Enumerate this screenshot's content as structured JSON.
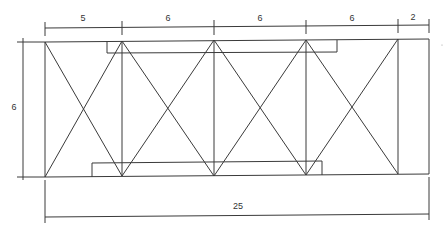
{
  "diagram": {
    "type": "truss-elevation",
    "units_label": "",
    "top_dimensions": [
      {
        "label": "5",
        "x": 83,
        "y": 18
      },
      {
        "label": "6",
        "x": 168,
        "y": 18
      },
      {
        "label": "6",
        "x": 260,
        "y": 18
      },
      {
        "label": "6",
        "x": 352,
        "y": 18
      },
      {
        "label": "2",
        "x": 413,
        "y": 17
      }
    ],
    "left_dimension": {
      "label": "6",
      "x": 14,
      "y": 107
    },
    "bottom_dimension": {
      "label": "25",
      "x": 238,
      "y": 206
    },
    "stroke_color": "#3a3a3a",
    "background": "#ffffff"
  }
}
